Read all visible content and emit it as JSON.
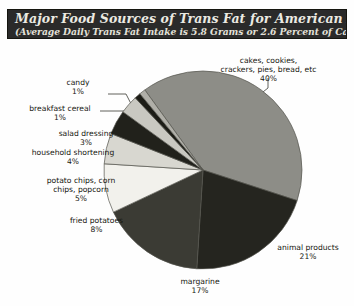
{
  "header": {
    "title": "Major Food Sources of Trans Fat for American Adults",
    "subtitle": "(Average Daily Trans Fat Intake is 5.8 Grams or 2.6 Percent of Calories)"
  },
  "chart_data": {
    "type": "pie",
    "title": "Major Food Sources of Trans Fat for American Adults",
    "subtitle": "(Average Daily Trans Fat Intake is 5.8 Grams or 2.6 Percent of Calories)",
    "unit": "percent",
    "legend": "none",
    "labels_show_percent": true,
    "categories": [
      "cakes, cookies, crackers, pies, bread, etc",
      "animal products",
      "margarine",
      "fried potatoes",
      "potato chips, corn chips, popcorn",
      "household shortening",
      "salad dressing",
      "breakfast cereal",
      "candy"
    ],
    "values": [
      40,
      21,
      17,
      8,
      5,
      4,
      3,
      1,
      1
    ],
    "slices": [
      {
        "name": "cakes, cookies, crackers, pies, bread, etc",
        "label_line1": "cakes, cookies,",
        "label_line2": "crackers, pies, bread, etc",
        "value": 40,
        "percent": "40%",
        "color": "#8d8d87"
      },
      {
        "name": "animal products",
        "label_line1": "animal products",
        "label_line2": "",
        "value": 21,
        "percent": "21%",
        "color": "#25251f"
      },
      {
        "name": "margarine",
        "label_line1": "margarine",
        "label_line2": "",
        "value": 17,
        "percent": "17%",
        "color": "#3b3b34"
      },
      {
        "name": "fried potatoes",
        "label_line1": "fried potatoes",
        "label_line2": "",
        "value": 8,
        "percent": "8%",
        "color": "#f2f1ec"
      },
      {
        "name": "potato chips, corn chips, popcorn",
        "label_line1": "potato chips, corn",
        "label_line2": "chips, popcorn",
        "value": 5,
        "percent": "5%",
        "color": "#d8d7d0"
      },
      {
        "name": "household shortening",
        "label_line1": "household shortening",
        "label_line2": "",
        "value": 4,
        "percent": "4%",
        "color": "#21211b"
      },
      {
        "name": "salad dressing",
        "label_line1": "salad dressing",
        "label_line2": "",
        "value": 3,
        "percent": "3%",
        "color": "#c9c8c1"
      },
      {
        "name": "breakfast cereal",
        "label_line1": "breakfast cereal",
        "label_line2": "",
        "value": 1,
        "percent": "1%",
        "color": "#1c1c16"
      },
      {
        "name": "candy",
        "label_line1": "candy",
        "label_line2": "",
        "value": 1,
        "percent": "1%",
        "color": "#b0afa8"
      }
    ]
  },
  "colors": {
    "banner_background": "#2a2a2a",
    "banner_text": "#eceae2",
    "page_background": "#fefefe",
    "label_text": "#16160f",
    "leader_line": "#3a3a33"
  }
}
